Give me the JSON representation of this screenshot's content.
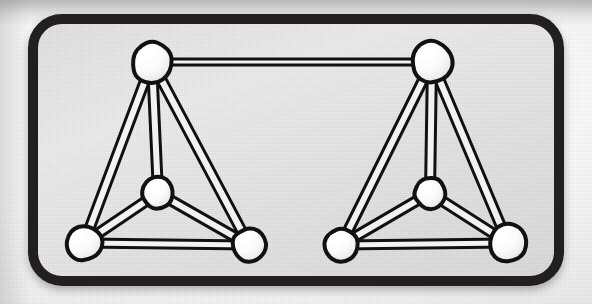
{
  "figure": {
    "style": "black-and-white halftone line drawing",
    "frame": {
      "shape": "rounded-rectangle",
      "border_color": "#231f20",
      "border_width_px": 10,
      "corner_radius_px": 34,
      "x": 28,
      "y": 14,
      "width": 536,
      "height": 272,
      "panel_fill": "#e6e6e6"
    },
    "page_background": "#f4f4f4",
    "node_style": {
      "fill": "#ffffff",
      "stroke": "#111111",
      "stroke_width_px": 4,
      "shading": "top-left highlight, lower-right soft gray"
    },
    "edge_style": {
      "type": "tube",
      "fill": "#f2f2f2",
      "stroke": "#111111",
      "stroke_width_px": 3
    }
  },
  "chart_data": {
    "type": "diagram",
    "diagram_kind": "graph",
    "groups": [
      {
        "name": "left-tetrahedron",
        "nodes": [
          {
            "id": "L-apex",
            "label": "apex",
            "x": 152,
            "y": 62,
            "r": 21
          },
          {
            "id": "L-center",
            "label": "center",
            "x": 158,
            "y": 193,
            "r": 16
          },
          {
            "id": "L-bl",
            "label": "bottom-left",
            "x": 84,
            "y": 243,
            "r": 18
          },
          {
            "id": "L-br",
            "label": "bottom-right",
            "x": 249,
            "y": 245,
            "r": 17
          }
        ],
        "edges": [
          {
            "from": "L-apex",
            "to": "L-bl",
            "width": 9
          },
          {
            "from": "L-apex",
            "to": "L-br",
            "width": 9
          },
          {
            "from": "L-apex",
            "to": "L-center",
            "width": 9
          },
          {
            "from": "L-center",
            "to": "L-bl",
            "width": 9
          },
          {
            "from": "L-center",
            "to": "L-br",
            "width": 9
          },
          {
            "from": "L-bl",
            "to": "L-br",
            "width": 8
          }
        ]
      },
      {
        "name": "right-tetrahedron",
        "nodes": [
          {
            "id": "R-apex",
            "label": "apex",
            "x": 432,
            "y": 62,
            "r": 21
          },
          {
            "id": "R-center",
            "label": "center",
            "x": 430,
            "y": 193,
            "r": 16
          },
          {
            "id": "R-bl",
            "label": "bottom-left",
            "x": 341,
            "y": 245,
            "r": 17
          },
          {
            "id": "R-br",
            "label": "bottom-right",
            "x": 508,
            "y": 243,
            "r": 19
          }
        ],
        "edges": [
          {
            "from": "R-apex",
            "to": "R-bl",
            "width": 9
          },
          {
            "from": "R-apex",
            "to": "R-br",
            "width": 9
          },
          {
            "from": "R-apex",
            "to": "R-center",
            "width": 9
          },
          {
            "from": "R-center",
            "to": "R-bl",
            "width": 9
          },
          {
            "from": "R-center",
            "to": "R-br",
            "width": 9
          },
          {
            "from": "R-bl",
            "to": "R-br",
            "width": 8
          }
        ]
      }
    ],
    "linking_edges": [
      {
        "from": "L-apex",
        "to": "R-apex",
        "width": 6,
        "orientation": "horizontal"
      }
    ],
    "node_count": 8,
    "edge_count": 13
  }
}
